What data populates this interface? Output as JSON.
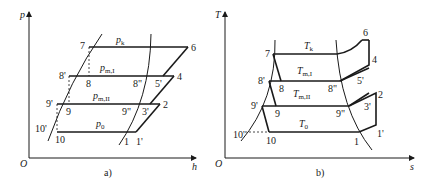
{
  "figure": {
    "panel_a": {
      "caption": "a)",
      "x_axis_label": "h",
      "y_axis_label": "p",
      "origin_label": "O",
      "pressure_labels": [
        {
          "main": "p",
          "sub": "k"
        },
        {
          "main": "p",
          "sub": "m,I"
        },
        {
          "main": "p",
          "sub": "m,II"
        },
        {
          "main": "p",
          "sub": "0"
        }
      ],
      "point_labels": [
        "7",
        "6",
        "8'",
        "8",
        "8\"",
        "5'",
        "4",
        "9'",
        "9",
        "9\"",
        "3'",
        "2",
        "10'",
        "10",
        "1",
        "1'"
      ]
    },
    "panel_b": {
      "caption": "b)",
      "x_axis_label": "s",
      "y_axis_label": "T",
      "origin_label": "O",
      "temperature_labels": [
        {
          "main": "T",
          "sub": "k"
        },
        {
          "main": "T",
          "sub": "m,I"
        },
        {
          "main": "T",
          "sub": "m,II"
        },
        {
          "main": "T",
          "sub": "0"
        }
      ],
      "point_labels": [
        "6",
        "7",
        "4",
        "8'",
        "8",
        "8\"",
        "5'",
        "2",
        "9'",
        "9",
        "9\"",
        "3'",
        "10'",
        "10",
        "1",
        "1'"
      ]
    }
  }
}
